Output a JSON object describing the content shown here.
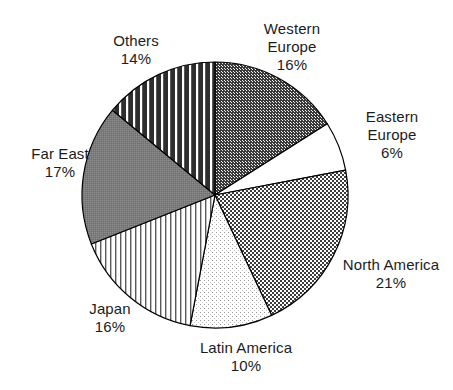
{
  "chart_data": {
    "type": "pie",
    "title": "",
    "subtitle": "",
    "xlabel": "",
    "ylabel": "",
    "legend_position": "none",
    "grid": false,
    "value_unit": "%",
    "start_angle_deg": 0,
    "direction": "clockwise",
    "categories": [
      "Western Europe",
      "Eastern Europe",
      "North America",
      "Latin America",
      "Japan",
      "Far East",
      "Others"
    ],
    "values": [
      16,
      6,
      21,
      10,
      16,
      17,
      14
    ],
    "slices": [
      {
        "name": "Western Europe",
        "value": 16,
        "label_line1": "Western",
        "label_line2": "Europe",
        "label_value": "16%",
        "label_text": "Western\nEurope\n16%",
        "fill_pattern": "dark-checkerboard",
        "fill_color": "#4d4d4d",
        "start_deg": 0,
        "end_deg": 57.6
      },
      {
        "name": "Eastern Europe",
        "value": 6,
        "label_line1": "Eastern",
        "label_line2": "Europe",
        "label_value": "6%",
        "label_text": "Eastern\nEurope\n6%",
        "fill_pattern": "solid-white",
        "fill_color": "#ffffff",
        "start_deg": 57.6,
        "end_deg": 79.2
      },
      {
        "name": "North America",
        "value": 21,
        "label_line1": "North America",
        "label_line2": "",
        "label_value": "21%",
        "label_text": "North America\n21%",
        "fill_pattern": "mid-checkerboard",
        "fill_color": "#808080",
        "start_deg": 79.2,
        "end_deg": 154.8
      },
      {
        "name": "Latin America",
        "value": 10,
        "label_line1": "Latin America",
        "label_line2": "",
        "label_value": "10%",
        "label_text": "Latin America\n10%",
        "fill_pattern": "light-dots",
        "fill_color": "#e8e8e8",
        "start_deg": 154.8,
        "end_deg": 190.8
      },
      {
        "name": "Japan",
        "value": 16,
        "label_line1": "Japan",
        "label_line2": "",
        "label_value": "16%",
        "label_text": "Japan\n16%",
        "fill_pattern": "thin-vertical-stripes",
        "fill_color": "#ffffff",
        "start_deg": 190.8,
        "end_deg": 248.4
      },
      {
        "name": "Far East",
        "value": 17,
        "label_line1": "Far East",
        "label_line2": "",
        "label_value": "17%",
        "label_text": "Far East\n17%",
        "fill_pattern": "medium-gray",
        "fill_color": "#7a7a7a",
        "start_deg": 248.4,
        "end_deg": 309.6
      },
      {
        "name": "Others",
        "value": 14,
        "label_line1": "Others",
        "label_line2": "",
        "label_value": "14%",
        "label_text": "Others\n14%",
        "fill_pattern": "bold-vertical-bars",
        "fill_color": "#333333",
        "start_deg": 309.6,
        "end_deg": 360
      }
    ]
  },
  "geometry": {
    "center_x": 215,
    "center_y": 195,
    "radius": 133,
    "outline_color": "#000000"
  }
}
